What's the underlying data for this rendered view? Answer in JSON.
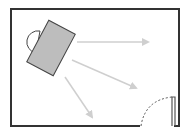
{
  "diagram": {
    "type": "floor-plan",
    "colors": {
      "wall": "#333333",
      "desk_fill": "#bdbdbd",
      "desk_stroke": "#444444",
      "chair_fill": "#ffffff",
      "arrow": "#cfcfcf",
      "door": "#555555"
    },
    "room": {
      "x": 11,
      "y": 9,
      "width": 168,
      "height": 117
    },
    "desk": {
      "cx": 51,
      "cy": 48,
      "width": 30,
      "height": 47,
      "rotation": 28
    },
    "chair": {
      "cx": 38,
      "cy": 42,
      "r": 11
    },
    "arrows": [
      {
        "x1": 77,
        "y1": 42,
        "x2": 148,
        "y2": 42
      },
      {
        "x1": 72,
        "y1": 60,
        "x2": 136,
        "y2": 88
      },
      {
        "x1": 65,
        "y1": 77,
        "x2": 93,
        "y2": 118
      }
    ],
    "door": {
      "opening_x1": 140,
      "opening_x2": 172,
      "jamb_x": 172,
      "top_y": 97
    }
  }
}
